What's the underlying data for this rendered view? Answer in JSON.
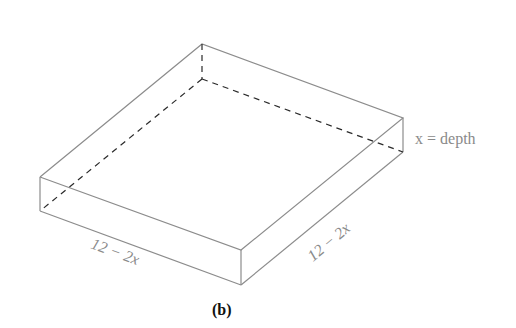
{
  "figure": {
    "caption": "(b)",
    "labels": {
      "depth": "x = depth",
      "front_edge": "12 − 2x",
      "right_edge": "12 − 2x"
    },
    "colors": {
      "edge": "#8c8c8c",
      "hidden_edge": "#2a2a2a",
      "label": "#8a8a8a",
      "caption": "#111111"
    }
  }
}
